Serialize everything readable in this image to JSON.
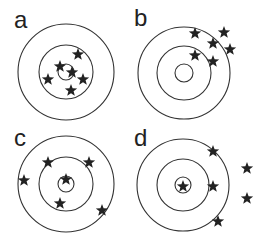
{
  "figure": {
    "colors": {
      "background": "#ffffff",
      "ring_stroke": "#333333",
      "star_fill": "#222222"
    },
    "star_size": 13,
    "panels": [
      {
        "label": "a",
        "label_pos": [
          14,
          8
        ],
        "center": [
          66,
          72
        ],
        "radii": [
          48,
          27,
          8
        ],
        "stars": [
          [
            78,
            54
          ],
          [
            60,
            66
          ],
          [
            72,
            72
          ],
          [
            48,
            79
          ],
          [
            83,
            79
          ],
          [
            71,
            90
          ]
        ]
      },
      {
        "label": "b",
        "label_pos": [
          134,
          6
        ],
        "center": [
          184,
          73
        ],
        "radii": [
          46,
          27,
          9
        ],
        "stars": [
          [
            195,
            33
          ],
          [
            224,
            32
          ],
          [
            213,
            43
          ],
          [
            230,
            49
          ],
          [
            195,
            55
          ],
          [
            213,
            61
          ]
        ]
      },
      {
        "label": "c",
        "label_pos": [
          14,
          126
        ],
        "center": [
          66,
          184
        ],
        "radii": [
          48,
          27,
          8
        ],
        "stars": [
          [
            48,
            162
          ],
          [
            89,
            162
          ],
          [
            24,
            180
          ],
          [
            66,
            179
          ],
          [
            60,
            203
          ],
          [
            102,
            210
          ]
        ]
      },
      {
        "label": "d",
        "label_pos": [
          134,
          126
        ],
        "center": [
          183,
          185
        ],
        "radii": [
          46,
          26,
          8
        ],
        "stars": [
          [
            213,
            151
          ],
          [
            183,
            186
          ],
          [
            213,
            186
          ],
          [
            247,
            168
          ],
          [
            247,
            198
          ],
          [
            218,
            221
          ]
        ]
      }
    ]
  }
}
